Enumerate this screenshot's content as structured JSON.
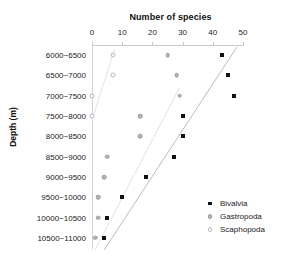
{
  "chart_data": {
    "type": "scatter",
    "title": "Number of species",
    "xlabel": "Number of species",
    "ylabel": "Depth (m)",
    "xlim": [
      0,
      50
    ],
    "ylim_categories_top_to_bottom": true,
    "xticks": [
      0,
      10,
      20,
      30,
      40,
      50
    ],
    "xtick_labels": [
      "0",
      "10",
      "20",
      "30",
      "40",
      "50"
    ],
    "grid": false,
    "legend_position": "bottom-right",
    "categories": [
      "6000~6500",
      "6500~7000",
      "7000~7500",
      "7500~8000",
      "8000~8500",
      "8500~9000",
      "9000~9500",
      "9500~10000",
      "10000~10500",
      "10500~11000"
    ],
    "series": [
      {
        "name": "Bivalvia",
        "marker": "filled-square",
        "color": "#111111",
        "values": [
          43,
          45,
          47,
          30,
          30,
          27,
          18,
          10,
          5,
          4
        ]
      },
      {
        "name": "Gastropoda",
        "marker": "filled-circle",
        "color": "#b6b6b6",
        "values": [
          25,
          28,
          29,
          16,
          16,
          5,
          4,
          2,
          2,
          1
        ]
      },
      {
        "name": "Scaphopoda",
        "marker": "open-circle",
        "color": "#ffffff",
        "values": [
          7,
          7,
          0,
          0,
          null,
          null,
          null,
          null,
          null,
          null
        ]
      }
    ],
    "trend_lines": [
      {
        "name": "bivalvia-trend",
        "x1": 4,
        "y1": 9.6,
        "x2": 48,
        "y2": -0.4,
        "color": "#bcbcbc"
      },
      {
        "name": "gastropoda-trend",
        "x1": 1,
        "y1": 9.6,
        "x2": 29,
        "y2": 1.6,
        "color": "#e2e2e2"
      },
      {
        "name": "scaphopoda-trend",
        "x1": 0,
        "y1": 3.2,
        "x2": 7.5,
        "y2": -0.3,
        "color": "#e2e2e2"
      }
    ]
  },
  "legend": {
    "items": [
      {
        "label": "Bivalvia",
        "swatch": "filled-square-marker"
      },
      {
        "label": "Gastropoda",
        "swatch": "filled-circle-marker"
      },
      {
        "label": "Scaphopoda",
        "swatch": "open-circle-marker"
      }
    ]
  }
}
